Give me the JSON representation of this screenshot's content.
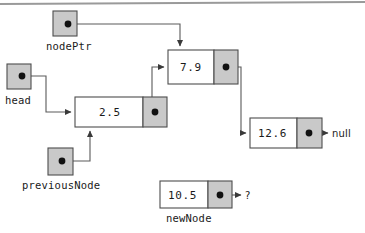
{
  "diagram": {
    "colors": {
      "background": "#ffffff",
      "node_data_fill": "#ffffff",
      "node_pointer_fill": "#c9c9c9",
      "pointer_box_fill": "#c9c9c9",
      "stroke": "#4d4d4d",
      "text": "#1a1a1a",
      "top_rule": "#9a9a9a"
    },
    "pointer_variables": [
      {
        "id": "nodePtr",
        "label": "nodePtr",
        "box": {
          "x": 53,
          "y": 11,
          "w": 24,
          "h": 25
        },
        "dot": {
          "cx": 68,
          "cy": 24
        },
        "label_pos": {
          "x": 46,
          "y": 50
        }
      },
      {
        "id": "head",
        "label": "head",
        "box": {
          "x": 7,
          "y": 64,
          "w": 24,
          "h": 25
        },
        "dot": {
          "cx": 22,
          "cy": 76
        },
        "label_pos": {
          "x": 5,
          "y": 104
        }
      },
      {
        "id": "previousNode",
        "label": "previousNode",
        "box": {
          "x": 48,
          "y": 148,
          "w": 25,
          "h": 27
        },
        "dot": {
          "cx": 62,
          "cy": 161
        },
        "label_pos": {
          "x": 22,
          "y": 189
        }
      }
    ],
    "nodes": [
      {
        "id": "node-2-5",
        "value": "2.5",
        "label": null,
        "data_cell": {
          "x": 75,
          "y": 97,
          "w": 68,
          "h": 30
        },
        "ptr_cell": {
          "x": 143,
          "y": 97,
          "w": 24,
          "h": 30
        },
        "dot": {
          "cx": 155,
          "cy": 112
        },
        "value_pos": {
          "x": 99,
          "y": 116
        }
      },
      {
        "id": "node-7-9",
        "value": "7.9",
        "label": null,
        "data_cell": {
          "x": 168,
          "y": 50,
          "w": 46,
          "h": 34
        },
        "ptr_cell": {
          "x": 214,
          "y": 50,
          "w": 24,
          "h": 34
        },
        "dot": {
          "cx": 226,
          "cy": 67
        },
        "value_pos": {
          "x": 180,
          "y": 71
        }
      },
      {
        "id": "node-12-6",
        "value": "12.6",
        "label": null,
        "data_cell": {
          "x": 250,
          "y": 118,
          "w": 47,
          "h": 30
        },
        "ptr_cell": {
          "x": 297,
          "y": 118,
          "w": 25,
          "h": 30
        },
        "dot": {
          "cx": 309,
          "cy": 133
        },
        "value_pos": {
          "x": 258,
          "y": 137
        }
      },
      {
        "id": "node-10-5",
        "value": "10.5",
        "label": "newNode",
        "data_cell": {
          "x": 160,
          "y": 181,
          "w": 48,
          "h": 27
        },
        "ptr_cell": {
          "x": 208,
          "y": 181,
          "w": 24,
          "h": 27
        },
        "dot": {
          "cx": 220,
          "cy": 195
        },
        "value_pos": {
          "x": 168,
          "y": 199
        },
        "label_pos": {
          "x": 166,
          "y": 222
        }
      }
    ],
    "terminators": [
      {
        "id": "null-terminator",
        "text": "null",
        "x": 332,
        "y": 137
      },
      {
        "id": "unknown-terminator",
        "text": "?",
        "x": 245,
        "y": 199
      }
    ],
    "connections": [
      {
        "id": "nodePtr-to-node-7-9",
        "from": "nodePtr",
        "to": "node-7-9",
        "path": "M 68 24 L 180 24 L 180 46"
      },
      {
        "id": "head-to-node-2-5",
        "from": "head",
        "to": "node-2-5",
        "path": "M 22 76 L 46 76 L 46 112 L 71 112"
      },
      {
        "id": "previousNode-to-node-2-5",
        "from": "previousNode",
        "to": "node-2-5",
        "path": "M 62 161 L 90 161 L 90 131"
      },
      {
        "id": "node-2-5-to-node-7-9",
        "from": "node-2-5",
        "to": "node-7-9",
        "path": "M 155 112 L 152 112 L 152 67 L 164 67"
      },
      {
        "id": "node-7-9-to-node-12-6",
        "from": "node-7-9",
        "to": "node-12-6",
        "path": "M 226 67 L 241 67 L 241 133 L 246 133"
      },
      {
        "id": "node-12-6-to-null",
        "from": "node-12-6",
        "to": "null-terminator",
        "path": "M 309 133 L 328 133"
      },
      {
        "id": "node-10-5-to-unknown",
        "from": "node-10-5",
        "to": "unknown-terminator",
        "path": "M 220 195 L 241 195"
      }
    ],
    "top_rule": {
      "x1": 0,
      "y1": 4,
      "x2": 365,
      "y2": 2
    }
  }
}
